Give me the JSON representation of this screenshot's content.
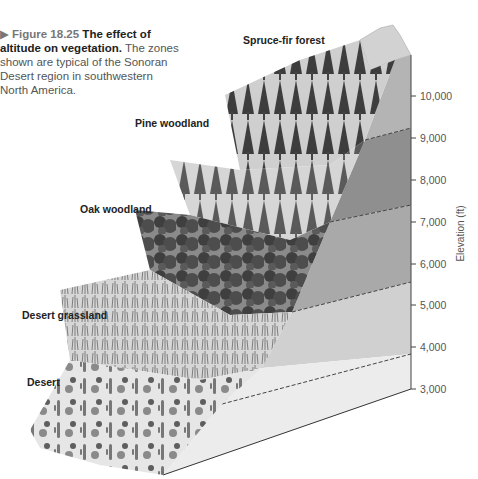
{
  "caption": {
    "figure_label": "▶ Figure 18.25",
    "title": "The effect of altitude on vegetation.",
    "body": "The zones shown are typical of the Sonoran Desert region in southwestern North America."
  },
  "zones": [
    {
      "label": "Spruce-fir forest"
    },
    {
      "label": "Pine woodland"
    },
    {
      "label": "Oak woodland"
    },
    {
      "label": "Desert grassland"
    },
    {
      "label": "Desert"
    }
  ],
  "axis": {
    "title": "Elevation (ft)",
    "ticks": [
      "10,000",
      "9,000",
      "8,000",
      "7,000",
      "6,000",
      "5,000",
      "4,000",
      "3,000"
    ]
  },
  "colors": {
    "band_spruce": "#b4b4b4",
    "band_pine": "#8f8f8f",
    "band_oak": "#a9a9a9",
    "band_grass": "#d0d0d0",
    "band_desert": "#ececec",
    "vegetation_dark": "#3a3a3a",
    "ground": "#d8d8d8"
  }
}
